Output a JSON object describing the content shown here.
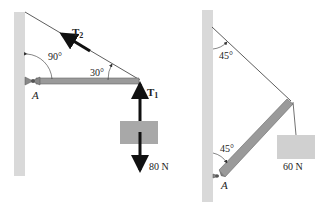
{
  "left_figure": {
    "tension_upper_label": "T",
    "tension_upper_sub": "2",
    "tension_lower_label": "T",
    "tension_lower_sub": "1",
    "angle_wall": "90°",
    "angle_beam": "30°",
    "pivot_label": "A",
    "weight_label": "80 N"
  },
  "right_figure": {
    "angle_top": "45°",
    "angle_bottom": "45°",
    "pivot_label": "A",
    "weight_label": "60 N"
  },
  "colors": {
    "wall": "#d9d9d9",
    "beam": "#9a9a9a",
    "box": "#a8a8a8",
    "box_light": "#d0d0d0",
    "arrow": "#111111",
    "line": "#333333"
  }
}
